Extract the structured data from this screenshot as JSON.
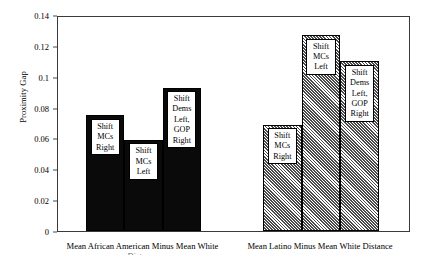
{
  "chart_data": {
    "type": "bar",
    "title": "",
    "xlabel": "",
    "ylabel": "Proximity Gap",
    "ylim": [
      0,
      0.14
    ],
    "ytick_labels": [
      "0",
      "0.02",
      "0.04",
      "0.06",
      "0.08",
      "0.1",
      "0.12",
      "0.14"
    ],
    "ytick_values": [
      0,
      0.02,
      0.04,
      0.06,
      0.08,
      0.1,
      0.12,
      0.14
    ],
    "grid": false,
    "legend": "none",
    "categories": [
      "Mean African American Minus Mean White Distance",
      "Mean Latino Minus Mean White Distance"
    ],
    "groups": [
      {
        "name": "Mean African American Minus Mean White Distance",
        "fill": "solid-black",
        "caption_line1": "Mean African American Minus Mean White",
        "caption_line2": "Distance",
        "bars": [
          {
            "label": "Shift\nMCs\nRight",
            "value": 0.075
          },
          {
            "label": "Shift\nMCs\nLeft",
            "value": 0.059
          },
          {
            "label": "Shift\nDems\nLeft,\nGOP\nRight",
            "value": 0.093
          }
        ]
      },
      {
        "name": "Mean Latino Minus Mean White Distance",
        "fill": "diagonal-hatch",
        "caption_line1": "Mean Latino Minus Mean White Distance",
        "caption_line2": "",
        "bars": [
          {
            "label": "Shift\nMCs\nRight",
            "value": 0.069
          },
          {
            "label": "Shift\nMCs\nLeft",
            "value": 0.127
          },
          {
            "label": "Shift\nDems\nLeft,\nGOP\nRight",
            "value": 0.11
          }
        ]
      }
    ],
    "colors": {
      "group1_fill": "#0a0a0a",
      "group2_fill": "#a8a8a8",
      "bar_border": "#000000",
      "axis": "#3a3a3a",
      "label_box_bg": "#ffffff"
    }
  }
}
